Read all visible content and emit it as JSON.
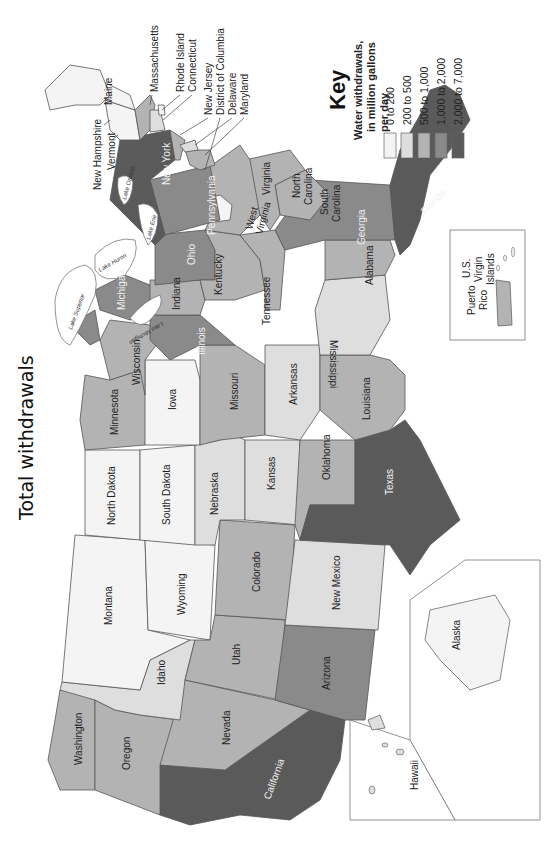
{
  "title": "Total withdrawals",
  "key": {
    "heading": "Key",
    "subtitle_lines": [
      "Water withdrawals,",
      "in million gallons",
      "per day"
    ],
    "items": [
      {
        "label": "0 to 200",
        "color": "#f4f4f4"
      },
      {
        "label": "200 to 500",
        "color": "#dedede"
      },
      {
        "label": "500 to 1,000",
        "color": "#b3b3b3"
      },
      {
        "label": "1,000 to 2,000",
        "color": "#8a8a8a"
      },
      {
        "label": "2,000 to 7,000",
        "color": "#5a5a5a"
      }
    ]
  },
  "orientation": "rotated 90 degrees clockwise",
  "states": {
    "Washington": "500 to 1,000",
    "Oregon": "500 to 1,000",
    "California": "2,000 to 7,000",
    "Nevada": "500 to 1,000",
    "Idaho": "200 to 500",
    "Montana": "0 to 200",
    "Wyoming": "0 to 200",
    "Utah": "500 to 1,000",
    "Arizona": "1,000 to 2,000",
    "Colorado": "500 to 1,000",
    "New Mexico": "200 to 500",
    "North Dakota": "0 to 200",
    "South Dakota": "0 to 200",
    "Nebraska": "200 to 500",
    "Kansas": "200 to 500",
    "Oklahoma": "500 to 1,000",
    "Texas": "2,000 to 7,000",
    "Minnesota": "500 to 1,000",
    "Iowa": "200 to 500",
    "Missouri": "500 to 1,000",
    "Arkansas": "200 to 500",
    "Louisiana": "500 to 1,000",
    "Wisconsin": "500 to 1,000",
    "Illinois": "1,000 to 2,000",
    "Michigan": "1,000 to 2,000",
    "Indiana": "500 to 1,000",
    "Ohio": "1,000 to 2,000",
    "Kentucky": "500 to 1,000",
    "Tennessee": "500 to 1,000",
    "Mississippi": "200 to 500",
    "Alabama": "500 to 1,000",
    "Georgia": "1,000 to 2,000",
    "Florida": "2,000 to 7,000",
    "South Carolina": "500 to 1,000",
    "North Carolina": "500 to 1,000",
    "Virginia": "500 to 1,000",
    "West Virginia": "0 to 200",
    "Pennsylvania": "1,000 to 2,000",
    "New York": "2,000 to 7,000",
    "New Jersey": "500 to 1,000",
    "Delaware": "200 to 500",
    "Maryland": "500 to 1,000",
    "District of Columbia": "0 to 200",
    "Connecticut": "200 to 500",
    "Rhode Island": "0 to 200",
    "Massachusetts": "500 to 1,000",
    "Vermont": "0 to 200",
    "New Hampshire": "0 to 200",
    "Maine": "0 to 200",
    "Alaska": "0 to 200",
    "Hawaii": "200 to 500",
    "Puerto Rico": "500 to 1,000",
    "U.S. Virgin Islands": "0 to 200"
  },
  "labels": {
    "washington": "Washington",
    "oregon": "Oregon",
    "california": "California",
    "nevada": "Nevada",
    "idaho": "Idaho",
    "montana": "Montana",
    "wyoming": "Wyoming",
    "utah": "Utah",
    "arizona": "Arizona",
    "colorado": "Colorado",
    "new_mexico": "New Mexico",
    "north_dakota": "North Dakota",
    "south_dakota": "South Dakota",
    "nebraska": "Nebraska",
    "kansas": "Kansas",
    "oklahoma": "Oklahoma",
    "texas": "Texas",
    "minnesota": "Minnesota",
    "iowa": "Iowa",
    "missouri": "Missouri",
    "arkansas": "Arkansas",
    "louisiana": "Louisiana",
    "wisconsin": "Wisconsin",
    "illinois": "Illinois",
    "michigan": "Michigan",
    "indiana": "Indiana",
    "ohio": "Ohio",
    "kentucky": "Kentucky",
    "tennessee": "Tennessee",
    "mississippi": "Mississippi",
    "alabama": "Alabama",
    "georgia": "Georgia",
    "florida": "Florida",
    "south_carolina_1": "South",
    "south_carolina_2": "Carolina",
    "north_carolina_1": "North",
    "north_carolina_2": "Carolina",
    "virginia": "Virginia",
    "west_virginia_1": "West",
    "west_virginia_2": "Virginia",
    "pennsylvania": "Pennsylvania",
    "new_york": "New York",
    "new_jersey": "New Jersey",
    "delaware": "Delaware",
    "maryland": "Maryland",
    "dc": "District of Columbia",
    "connecticut": "Connecticut",
    "rhode_island": "Rhode Island",
    "massachusetts": "Massachusetts",
    "vermont": "Vermont",
    "new_hampshire": "New Hampshire",
    "maine": "Maine",
    "alaska": "Alaska",
    "hawaii": "Hawaii",
    "puerto_rico_1": "Puerto",
    "puerto_rico_2": "Rico",
    "usvi_1": "U.S.",
    "usvi_2": "Virgin",
    "usvi_3": "Islands"
  },
  "lakes": {
    "superior": "Lake Superior",
    "michigan": "Lake Michigan",
    "huron": "Lake Huron",
    "erie": "Lake Erie",
    "ontario": "Lake Ontario"
  }
}
